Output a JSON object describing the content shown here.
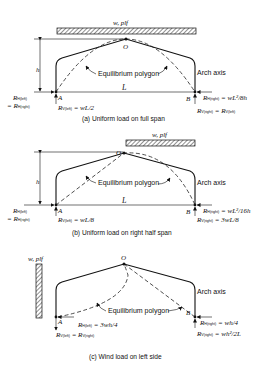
{
  "figure": {
    "panels": [
      {
        "id": "a",
        "caption": "(a) Uniform load on full span",
        "load_label": "w, plf",
        "crown_label": "O",
        "height_label": "h",
        "span_label": "L",
        "left_support": "A",
        "right_support": "B",
        "equilibrium_label": "Equilibrium polygon",
        "arch_axis_label": "Arch axis",
        "left_reactions": {
          "h_line1": "R",
          "h_sub1": "H(left)",
          "h_line2": "= R",
          "h_sub2": "H(right)",
          "v": "R",
          "v_sub": "V(left)",
          "v_value": " = wL/2"
        },
        "right_reactions": {
          "h": "R",
          "h_sub": "H(right)",
          "h_value": " = wL²/8h",
          "v": "R",
          "v_sub": "V(right)",
          "v_eq": " = R",
          "v_eq_sub": "V(left)"
        }
      },
      {
        "id": "b",
        "caption": "(b) Uniform load on right half span",
        "load_label": "w, plf",
        "crown_label": "O",
        "height_label": "h",
        "span_label": "L",
        "left_support": "A",
        "right_support": "B",
        "equilibrium_label": "Equilibrium polygon",
        "arch_axis_label": "Arch axis",
        "left_reactions": {
          "h_line1": "R",
          "h_sub1": "H(left)",
          "h_line2": "= R",
          "h_sub2": "H(right)",
          "v": "R",
          "v_sub": "V(left)",
          "v_value": " = wL/8"
        },
        "right_reactions": {
          "h": "R",
          "h_sub": "H(right)",
          "h_value": " = wL²/16h",
          "v": "R",
          "v_sub": "V(right)",
          "v_value": " = 3wL/8"
        }
      },
      {
        "id": "c",
        "caption": "(c) Wind load on left side",
        "load_label": "w, plf",
        "crown_label": "O",
        "left_support": "A",
        "right_support": "B",
        "equilibrium_label": "Equilibrium polygon",
        "arch_axis_label": "Arch axis",
        "left_reactions": {
          "h": "R",
          "h_sub": "H(left)",
          "h_value": " = 3wh/4",
          "v": "R",
          "v_sub": "V(left)",
          "v_eq": " = R",
          "v_eq_sub": "V(right)"
        },
        "right_reactions": {
          "h": "R",
          "h_sub": "H(right)",
          "h_value": " = wh/4",
          "v": "R",
          "v_sub": "V(right)",
          "v_value": " = wh²/2L"
        }
      }
    ]
  }
}
